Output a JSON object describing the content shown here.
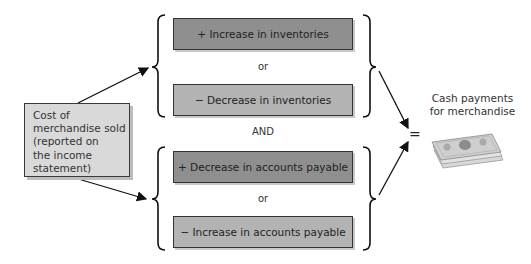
{
  "source": {
    "lines": [
      "Cost of",
      "merchandise sold",
      "(reported on",
      "the income",
      "statement)"
    ]
  },
  "inventory_group": {
    "option1": "+ Increase in inventories",
    "connector": "or",
    "option2": "− Decrease in inventories"
  },
  "joiner": "AND",
  "payable_group": {
    "option1": "+ Decrease in accounts payable",
    "connector": "or",
    "option2": "− Increase in accounts payable"
  },
  "result": {
    "equals": "=",
    "lines": [
      "Cash payments",
      "for merchandise"
    ],
    "icon": "money-stack-icon"
  },
  "colors": {
    "source_box": "#d9d9d9",
    "option_dark": "#8f8f8f",
    "option_light": "#b3b3b3"
  }
}
